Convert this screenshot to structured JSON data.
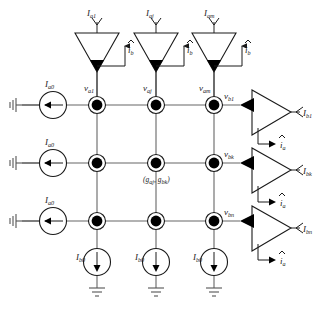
{
  "figure": {
    "background_color": "#ffffff",
    "line_color": "#666666",
    "node_color": "#000000",
    "text_color": "#1a1a1a",
    "width": 313,
    "height": 311
  },
  "top_inputs": [
    {
      "current_label": "I",
      "current_sub": "a1",
      "out_label": "i",
      "out_sub": "b"
    },
    {
      "current_label": "I",
      "current_sub": "aj",
      "out_label": "i",
      "out_sub": "b"
    },
    {
      "current_label": "I",
      "current_sub": "am",
      "out_label": "i",
      "out_sub": "b"
    }
  ],
  "column_voltages": [
    {
      "label": "v",
      "sub": "a1"
    },
    {
      "label": "v",
      "sub": "aj"
    },
    {
      "label": "v",
      "sub": "am"
    }
  ],
  "left_sources": [
    {
      "label": "I",
      "sub": "a0"
    },
    {
      "label": "I",
      "sub": "a0"
    },
    {
      "label": "I",
      "sub": "a0"
    }
  ],
  "bottom_sources": [
    {
      "label": "I",
      "sub": "b0"
    },
    {
      "label": "I",
      "sub": "b0"
    },
    {
      "label": "I",
      "sub": "b0"
    }
  ],
  "row_voltages": [
    {
      "label": "v",
      "sub": "b1"
    },
    {
      "label": "v",
      "sub": "bk"
    },
    {
      "label": "v",
      "sub": "bn"
    }
  ],
  "right_outputs": [
    {
      "current_label": "I",
      "current_sub": "b1",
      "out_label": "i",
      "out_sub": "a"
    },
    {
      "current_label": "I",
      "current_sub": "bk",
      "out_label": "i",
      "out_sub": "a"
    },
    {
      "current_label": "I",
      "current_sub": "bn",
      "out_label": "i",
      "out_sub": "a"
    }
  ],
  "conductance_annotation": {
    "open_paren": "(",
    "first_label": "g",
    "first_sub": "aj",
    "separator": ", ",
    "second_label": "g",
    "second_sub": "bk",
    "close_paren": ")"
  }
}
